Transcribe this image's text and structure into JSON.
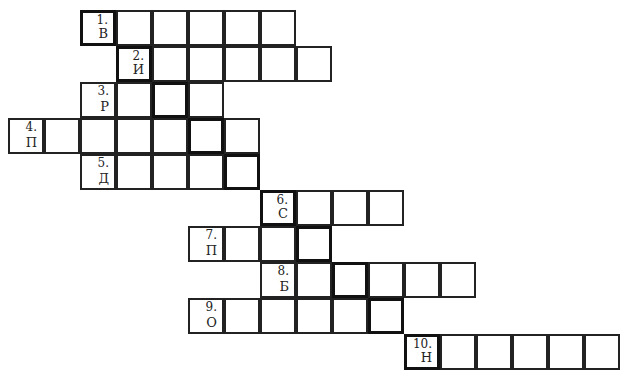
{
  "puzzle": {
    "cell_size": 36,
    "origin_x": 9,
    "origin_y": 11,
    "rows": [
      {
        "number": "1.",
        "letter": "В",
        "start_col": 2,
        "length": 6,
        "key_col": 2
      },
      {
        "number": "2.",
        "letter": "И",
        "start_col": 3,
        "length": 6,
        "key_col": 3
      },
      {
        "number": "3.",
        "letter": "Р",
        "start_col": 2,
        "length": 4,
        "key_col": 4
      },
      {
        "number": "4.",
        "letter": "П",
        "start_col": 0,
        "length": 7,
        "key_col": 5
      },
      {
        "number": "5.",
        "letter": "Д",
        "start_col": 2,
        "length": 5,
        "key_col": 6
      },
      {
        "number": "6.",
        "letter": "С",
        "start_col": 7,
        "length": 4,
        "key_col": 7
      },
      {
        "number": "7.",
        "letter": "П",
        "start_col": 5,
        "length": 4,
        "key_col": 8
      },
      {
        "number": "8.",
        "letter": "Б",
        "start_col": 7,
        "length": 6,
        "key_col": 9
      },
      {
        "number": "9.",
        "letter": "О",
        "start_col": 5,
        "length": 6,
        "key_col": 10
      },
      {
        "number": "10.",
        "letter": "Н",
        "start_col": 11,
        "length": 6,
        "key_col": 11
      }
    ]
  }
}
